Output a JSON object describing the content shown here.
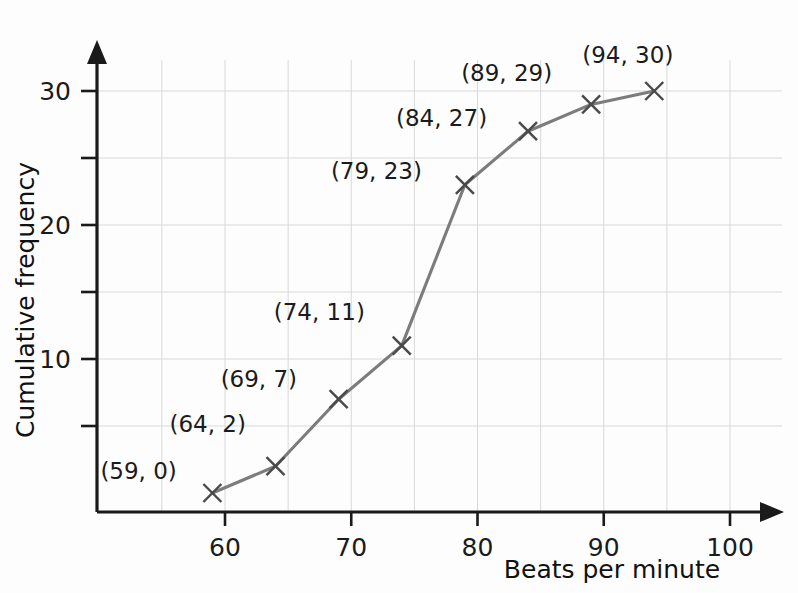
{
  "chart_data": {
    "type": "line",
    "title": "",
    "subtitle": "",
    "xlabel": "Beats per minute",
    "ylabel": "Cumulative frequency",
    "xlim": [
      54,
      104
    ],
    "ylim": [
      0,
      33
    ],
    "x_ticks": [
      60,
      70,
      80,
      90,
      100
    ],
    "x_tick_labels": [
      "60",
      "70",
      "80",
      "90",
      "100"
    ],
    "x_minor_ticks": [
      55,
      65,
      75,
      85,
      95
    ],
    "y_ticks": [
      5,
      10,
      15,
      20,
      25,
      30
    ],
    "y_tick_labels": [
      "",
      "10",
      "",
      "20",
      "",
      "30"
    ],
    "y_labeled_ticks": [
      10,
      20,
      30
    ],
    "grid": true,
    "grid_x_spacing": 5,
    "grid_y_spacing": 5,
    "legend": "none",
    "x": [
      59,
      64,
      69,
      74,
      79,
      84,
      89,
      94
    ],
    "values": [
      0,
      2,
      7,
      11,
      23,
      27,
      29,
      30
    ],
    "points": [
      {
        "x": 59,
        "y": 0,
        "label": "(59, 0)",
        "label_dx": -112,
        "label_dy": -14,
        "label_anchor": "start"
      },
      {
        "x": 64,
        "y": 2,
        "label": "(64, 2)",
        "label_dx": -106,
        "label_dy": -34,
        "label_anchor": "start"
      },
      {
        "x": 69,
        "y": 7,
        "label": "(69, 7)",
        "label_dx": -118,
        "label_dy": -12,
        "label_anchor": "start"
      },
      {
        "x": 74,
        "y": 11,
        "label": "(74, 11)",
        "label_dx": -128,
        "label_dy": -26,
        "label_anchor": "start"
      },
      {
        "x": 79,
        "y": 23,
        "label": "(79, 23)",
        "label_dx": -134,
        "label_dy": -6,
        "label_anchor": "start"
      },
      {
        "x": 84,
        "y": 27,
        "label": "(84, 27)",
        "label_dx": -132,
        "label_dy": -5,
        "label_anchor": "start"
      },
      {
        "x": 89,
        "y": 29,
        "label": "(89, 29)",
        "label_dx": -130,
        "label_dy": -23,
        "label_anchor": "start"
      },
      {
        "x": 94,
        "y": 30,
        "label": "(94, 30)",
        "label_dx": -72,
        "label_dy": -28,
        "label_anchor": "start"
      }
    ],
    "marker_style": "x",
    "line_color": "#7c7c7c",
    "marker_color": "#4a4a4a",
    "grid_color": "#d9d9d9",
    "axis_color": "#1a1a1a",
    "background_color": "#fdfdfd"
  },
  "axes": {
    "x_title": "Beats per minute",
    "y_title": "Cumulative frequency"
  }
}
